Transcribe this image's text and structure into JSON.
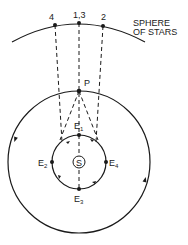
{
  "diagram": {
    "sphere_label_line1": "SPHERE",
    "sphere_label_line2": "OF STARS",
    "star_positions": [
      {
        "label": "4"
      },
      {
        "label": "1,3"
      },
      {
        "label": "2"
      }
    ],
    "planet_label": "P",
    "sun_label": "S",
    "earth_positions": [
      {
        "label": "E",
        "sub": "1"
      },
      {
        "label": "E",
        "sub": "2"
      },
      {
        "label": "E",
        "sub": "3"
      },
      {
        "label": "E",
        "sub": "4"
      }
    ]
  }
}
